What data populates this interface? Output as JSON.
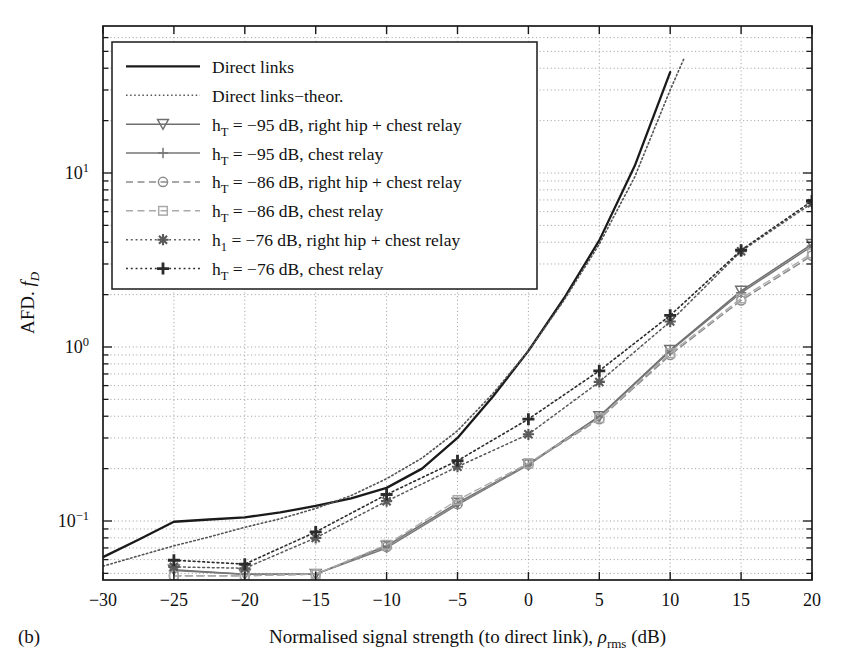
{
  "figure": {
    "panel_label": "(b)",
    "xlabel_parts": {
      "main": "Normalised signal strength (to direct link), ",
      "symbol": "ρ",
      "sub": "rms",
      "unit": " (dB)"
    },
    "ylabel_parts": {
      "main": "AFD. ",
      "symbol": "f",
      "sub": "D"
    }
  },
  "legend": {
    "items": [
      {
        "label": "Direct links",
        "style": "solid",
        "marker": "none",
        "color": "#1a1a1a",
        "width": 2.3
      },
      {
        "label": "Direct links−theor.",
        "style": "dotted-fine",
        "marker": "none",
        "color": "#555555",
        "width": 1.6
      },
      {
        "label": "h_T = −95 dB, right hip + chest relay",
        "label_main": "h",
        "label_sub": "T",
        "label_rest": " = −95 dB, right hip + chest relay",
        "style": "solid",
        "marker": "triangle-down",
        "color": "#6f6f6f",
        "width": 1.5
      },
      {
        "label": "h_T = −95 dB, chest relay",
        "label_main": "h",
        "label_sub": "T",
        "label_rest": " = −95 dB, chest relay",
        "style": "solid",
        "marker": "plus",
        "color": "#767676",
        "width": 1.5
      },
      {
        "label": "h_T = −86 dB, right hip + chest relay",
        "label_main": "h",
        "label_sub": "T",
        "label_rest": " = −86 dB, right hip + chest relay",
        "style": "dashed",
        "marker": "circle",
        "color": "#8c8c8c",
        "width": 1.5
      },
      {
        "label": "h_T = −86 dB, chest relay",
        "label_main": "h",
        "label_sub": "T",
        "label_rest": " = −86 dB, chest relay",
        "style": "dashed",
        "marker": "square",
        "color": "#aaaaaa",
        "width": 1.4
      },
      {
        "label": "h_1 = −76 dB, right hip + chest relay",
        "label_main": "h",
        "label_sub": "1",
        "label_rest": " = −76 dB, right hip + chest relay",
        "style": "dotted",
        "marker": "asterisk",
        "color": "#5a5a5a",
        "width": 1.5
      },
      {
        "label": "h_T = −76 dB, chest relay",
        "label_main": "h",
        "label_sub": "T",
        "label_rest": " = −76 dB, chest relay",
        "style": "dotted",
        "marker": "plus-bold",
        "color": "#2b2b2b",
        "width": 1.6
      }
    ]
  },
  "chart_data": {
    "type": "line",
    "title": "",
    "xlabel": "Normalised signal strength (to direct link), ρrms (dB)",
    "ylabel": "AFD. fD",
    "xlim": [
      -30,
      20
    ],
    "ylim": [
      0.046,
      50
    ],
    "yscale": "log",
    "xticks": [
      -30,
      -25,
      -20,
      -15,
      -10,
      -5,
      0,
      5,
      10,
      15,
      20
    ],
    "xtick_labels": [
      "−30",
      "−25",
      "−20",
      "−15",
      "−10",
      "−5",
      "0",
      "5",
      "10",
      "15",
      "20"
    ],
    "yticks": [
      0.1,
      1,
      10
    ],
    "ytick_labels": [
      "10⁻¹",
      "10⁰",
      "10¹"
    ],
    "grid": true,
    "legend_position": "upper-left",
    "series": [
      {
        "name": "Direct links",
        "style": "solid",
        "marker": "none",
        "color": "#1a1a1a",
        "width": 2.3,
        "x": [
          -30,
          -27.5,
          -25,
          -22.5,
          -20,
          -17.5,
          -15,
          -12.5,
          -10,
          -7.5,
          -5,
          -2.5,
          0,
          2.5,
          5,
          7.5,
          10
        ],
        "y": [
          0.062,
          0.078,
          0.099,
          0.102,
          0.105,
          0.112,
          0.122,
          0.135,
          0.155,
          0.2,
          0.3,
          0.52,
          0.95,
          1.9,
          4.1,
          11.0,
          38.0
        ]
      },
      {
        "name": "Direct links−theor.",
        "style": "dotted-fine",
        "marker": "none",
        "color": "#555555",
        "width": 1.6,
        "x": [
          -30,
          -27.5,
          -25,
          -22.5,
          -20,
          -17.5,
          -15,
          -12.5,
          -10,
          -7.5,
          -5,
          -2.5,
          0,
          2.5,
          5,
          7.5,
          10,
          11
        ],
        "y": [
          0.055,
          0.063,
          0.072,
          0.081,
          0.092,
          0.103,
          0.118,
          0.14,
          0.175,
          0.23,
          0.33,
          0.54,
          0.95,
          1.85,
          3.9,
          9.5,
          30.0,
          46.0
        ]
      },
      {
        "name": "h_T = −95 dB, right hip + chest relay",
        "style": "solid",
        "marker": "triangle-down",
        "color": "#6f6f6f",
        "width": 1.5,
        "x": [
          -25,
          -20,
          -15,
          -10,
          -5,
          0,
          5,
          10,
          15,
          20
        ],
        "y": [
          0.0525,
          0.0495,
          0.0495,
          0.072,
          0.127,
          0.212,
          0.4,
          0.96,
          2.1,
          3.9
        ]
      },
      {
        "name": "h_T = −95 dB, chest relay",
        "style": "solid",
        "marker": "plus",
        "color": "#767676",
        "width": 1.5,
        "x": [
          -25,
          -20,
          -15,
          -10,
          -5,
          0,
          5,
          10,
          15,
          20
        ],
        "y": [
          0.052,
          0.0495,
          0.0495,
          0.07,
          0.124,
          0.21,
          0.395,
          0.95,
          2.05,
          3.8
        ]
      },
      {
        "name": "h_T = −86 dB, right hip + chest relay",
        "style": "dashed",
        "marker": "circle",
        "color": "#8c8c8c",
        "width": 1.5,
        "x": [
          -25,
          -20,
          -15,
          -10,
          -5,
          0,
          5,
          10,
          15,
          20
        ],
        "y": [
          0.0485,
          0.0485,
          0.0495,
          0.071,
          0.125,
          0.212,
          0.385,
          0.9,
          1.85,
          3.35
        ]
      },
      {
        "name": "h_T = −86 dB, chest relay",
        "style": "dashed",
        "marker": "square",
        "color": "#aaaaaa",
        "width": 1.4,
        "x": [
          -25,
          -20,
          -15,
          -10,
          -5,
          0,
          5,
          10,
          15,
          20
        ],
        "y": [
          0.0485,
          0.0485,
          0.0495,
          0.073,
          0.132,
          0.215,
          0.39,
          0.92,
          1.9,
          3.45
        ]
      },
      {
        "name": "h_1 = −76 dB, right hip + chest relay",
        "style": "dotted",
        "marker": "asterisk",
        "color": "#5a5a5a",
        "width": 1.5,
        "x": [
          -25,
          -20,
          -15,
          -10,
          -5,
          0,
          5,
          10,
          15,
          20
        ],
        "y": [
          0.0545,
          0.0535,
          0.08,
          0.13,
          0.205,
          0.315,
          0.63,
          1.4,
          3.55,
          6.7
        ]
      },
      {
        "name": "h_T = −76 dB, chest relay",
        "style": "dotted",
        "marker": "plus-bold",
        "color": "#2b2b2b",
        "width": 1.6,
        "x": [
          -25,
          -20,
          -15,
          -10,
          -5,
          0,
          5,
          10,
          15,
          20
        ],
        "y": [
          0.0595,
          0.0565,
          0.0865,
          0.142,
          0.222,
          0.385,
          0.73,
          1.52,
          3.6,
          6.9
        ]
      }
    ]
  }
}
